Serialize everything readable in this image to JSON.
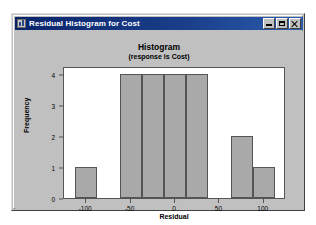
{
  "window": {
    "title": "Residual Histogram for Cost",
    "icon": "graph-window-icon",
    "controls": {
      "minimize_label": "Minimize",
      "maximize_label": "Maximize",
      "close_label": "Close"
    }
  },
  "chart_data": {
    "type": "bar",
    "title": "Histogram",
    "subtitle": "(response is Cost)",
    "xlabel": "Residual",
    "ylabel": "Frequency",
    "xlim": [
      -125,
      125
    ],
    "ylim": [
      0,
      4.25
    ],
    "xticks": [
      -100,
      -50,
      0,
      50,
      100
    ],
    "xtick_labels": [
      "-100",
      "-50",
      "0",
      "50",
      "100"
    ],
    "yticks": [
      0,
      1,
      2,
      3,
      4
    ],
    "ytick_labels": [
      "0",
      "1",
      "2",
      "3",
      "4"
    ],
    "grid": false,
    "legend": null,
    "bin_width": 25,
    "bars": [
      {
        "bin_start": -112.5,
        "bin_end": -87.5,
        "center": -100,
        "value": 1
      },
      {
        "bin_start": -62.5,
        "bin_end": -37.5,
        "center": -50,
        "value": 4
      },
      {
        "bin_start": -37.5,
        "bin_end": -12.5,
        "center": -25,
        "value": 4
      },
      {
        "bin_start": -12.5,
        "bin_end": 12.5,
        "center": 0,
        "value": 4
      },
      {
        "bin_start": 12.5,
        "bin_end": 37.5,
        "center": 25,
        "value": 4
      },
      {
        "bin_start": 62.5,
        "bin_end": 87.5,
        "center": 75,
        "value": 2
      },
      {
        "bin_start": 87.5,
        "bin_end": 112.5,
        "center": 100,
        "value": 1
      }
    ],
    "colors": {
      "bar_fill": "#a9a9a9",
      "bar_edge": "#555555",
      "plot_background": "#ffffff",
      "canvas_background": "#c0c0c0",
      "axis": "#555555",
      "text": "#000000"
    }
  }
}
